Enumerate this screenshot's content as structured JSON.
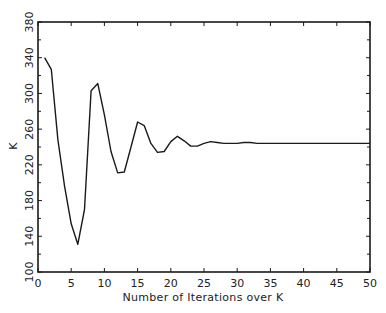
{
  "chart_data": {
    "type": "line",
    "title": "",
    "xlabel": "Number of Iterations over K",
    "ylabel": "K",
    "xlim": [
      0,
      50
    ],
    "ylim": [
      100,
      380
    ],
    "x_ticks": [
      0,
      5,
      10,
      15,
      20,
      25,
      30,
      35,
      40,
      45,
      50
    ],
    "y_ticks": [
      100,
      140,
      180,
      220,
      260,
      300,
      340,
      380
    ],
    "grid": false,
    "legend": null,
    "series": [
      {
        "name": "K",
        "color": "#1a1a1a",
        "x": [
          1,
          2,
          3,
          4,
          5,
          6,
          7,
          8,
          9,
          10,
          11,
          12,
          13,
          14,
          15,
          16,
          17,
          18,
          19,
          20,
          21,
          22,
          23,
          24,
          25,
          26,
          27,
          28,
          29,
          30,
          31,
          32,
          33,
          34,
          35,
          36,
          37,
          38,
          39,
          40,
          41,
          42,
          43,
          44,
          45,
          46,
          47,
          48,
          49,
          50
        ],
        "values": [
          340,
          327,
          248,
          196,
          154,
          131,
          170,
          303,
          311,
          276,
          235,
          211,
          212,
          240,
          268,
          264,
          244,
          234,
          235,
          246,
          252,
          247,
          241,
          241,
          244,
          246,
          245,
          244,
          244,
          244,
          245,
          245,
          244,
          244,
          244,
          244,
          244,
          244,
          244,
          244,
          244,
          244,
          244,
          244,
          244,
          244,
          244,
          244,
          244,
          244
        ]
      }
    ]
  }
}
